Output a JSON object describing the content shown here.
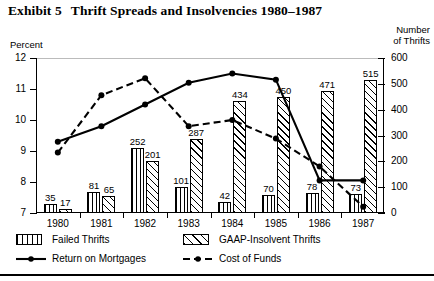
{
  "title": {
    "label": "Exhibit 5",
    "text": "Thrift Spreads and Insolvencies 1980–1987"
  },
  "axes": {
    "left_caption": "Percent",
    "right_caption_line1": "Number",
    "right_caption_line2": "of Thrifts"
  },
  "legend": {
    "failed": "Failed Thrifts",
    "gaap": "GAAP-Insolvent Thrifts",
    "return": "Return on Mortgages",
    "cost": "Cost of Funds"
  },
  "chart_data": {
    "type": "bar",
    "title": "Thrift Spreads and Insolvencies 1980–1987",
    "xlabel": "",
    "ylabel": "Percent",
    "y2label": "Number of Thrifts",
    "ylim": [
      7,
      12
    ],
    "y2lim": [
      0,
      600
    ],
    "yticks": [
      7,
      8,
      9,
      10,
      11,
      12
    ],
    "y2ticks": [
      0,
      100,
      200,
      300,
      400,
      500,
      600
    ],
    "grid": false,
    "legend_position": "below",
    "categories": [
      "1980",
      "1981",
      "1982",
      "1983",
      "1984",
      "1985",
      "1986",
      "1987"
    ],
    "series": [
      {
        "name": "Failed Thrifts",
        "axis": "right",
        "kind": "bar",
        "values": [
          35,
          81,
          252,
          101,
          42,
          70,
          78,
          73
        ]
      },
      {
        "name": "GAAP-Insolvent Thrifts",
        "axis": "right",
        "kind": "bar",
        "values": [
          17,
          65,
          201,
          287,
          434,
          450,
          471,
          515
        ]
      },
      {
        "name": "Return on Mortgages",
        "axis": "left",
        "kind": "line",
        "values": [
          9.3,
          9.8,
          10.5,
          11.2,
          11.5,
          11.3,
          8.05,
          8.05
        ]
      },
      {
        "name": "Cost of Funds",
        "axis": "left",
        "kind": "line",
        "values": [
          8.95,
          10.8,
          11.35,
          9.8,
          10.0,
          9.4,
          8.5,
          7.2
        ]
      }
    ]
  }
}
